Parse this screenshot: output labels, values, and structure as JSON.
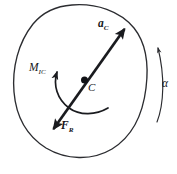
{
  "figure": {
    "background_color": "#ffffff",
    "ink_color": "#1a1b1f",
    "outline_color": "#2b2c30",
    "width": 177,
    "height": 174
  },
  "labels": {
    "acceleration": {
      "symbol": "a",
      "subscript": "C",
      "text": "aC"
    },
    "moment": {
      "symbol": "M",
      "subscript": "IC",
      "text": "MIC"
    },
    "force": {
      "symbol": "F",
      "subscript": "R",
      "text": "FR"
    },
    "center": {
      "symbol": "C",
      "text": "C"
    },
    "angular_acceleration": {
      "symbol": "α",
      "text": "α"
    }
  },
  "elements": {
    "body_outline": {
      "name": "irregular-rigid-body-blob",
      "stroke_width": 1.3
    },
    "center_dot": {
      "name": "center-of-mass-point",
      "cx": 84,
      "cy": 80,
      "r": 3.4
    },
    "main_vector": {
      "name": "double-headed-vector-through-C",
      "tail_x": 52,
      "tail_y": 131,
      "head_x": 126,
      "head_y": 27,
      "stroke_width": 2.6
    },
    "moment_arc": {
      "name": "counterclockwise-moment-arc",
      "stroke_width": 1.6,
      "direction": "counterclockwise"
    },
    "alpha_arc": {
      "name": "angular-acceleration-arc",
      "stroke_width": 1.2,
      "direction": "counterclockwise"
    }
  }
}
